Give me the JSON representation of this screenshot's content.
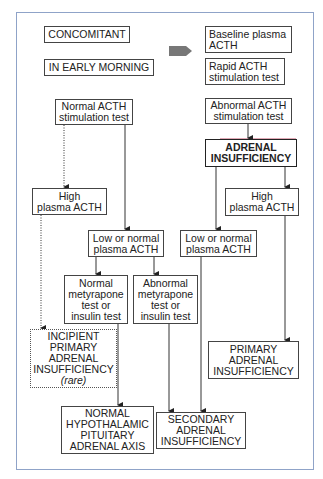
{
  "diagram": {
    "header": {
      "left": [
        "CONCOMITANT",
        "IN EARLY MORNING"
      ],
      "right": [
        {
          "lines": [
            "Baseline plasma",
            "ACTH"
          ]
        },
        {
          "lines": [
            "Rapid ACTH",
            "stimulation test"
          ]
        }
      ]
    },
    "nodes": {
      "normal_acth_stim": {
        "lines": [
          "Normal ACTH",
          "stimulation test"
        ]
      },
      "abnormal_acth_stim": {
        "lines": [
          "Abnormal ACTH",
          "stimulation test"
        ]
      },
      "adrenal_insufficiency": {
        "lines": [
          "ADRENAL",
          "INSUFFICIENCY"
        ]
      },
      "high_plasma_acth_left": {
        "lines": [
          "High",
          "plasma ACTH"
        ]
      },
      "high_plasma_acth_right": {
        "lines": [
          "High",
          "plasma ACTH"
        ]
      },
      "low_normal_acth_left": {
        "lines": [
          "Low or normal",
          "plasma ACTH"
        ]
      },
      "low_normal_acth_right": {
        "lines": [
          "Low or normal",
          "plasma ACTH"
        ]
      },
      "normal_metyrapone": {
        "lines": [
          "Normal",
          "metyrapone",
          "test or",
          "insulin test"
        ]
      },
      "abnormal_metyrapone": {
        "lines": [
          "Abnormal",
          "metyrapone",
          "test or",
          "insulin test"
        ]
      },
      "incipient_primary": {
        "lines": [
          "INCIPIENT",
          "PRIMARY",
          "ADRENAL",
          "INSUFFICIENCY"
        ],
        "note": "(rare)"
      },
      "primary_ai": {
        "lines": [
          "PRIMARY",
          "ADRENAL",
          "INSUFFICIENCY"
        ]
      },
      "normal_hpa": {
        "lines": [
          "NORMAL",
          "HYPOTHALAMIC",
          "PITUITARY",
          "ADRENAL AXIS"
        ]
      },
      "secondary_ai": {
        "lines": [
          "SECONDARY",
          "ADRENAL",
          "INSUFFICIENCY"
        ]
      }
    },
    "edges": [
      {
        "from": "normal_acth_stim",
        "to": "high_plasma_acth_left",
        "style": "dotted"
      },
      {
        "from": "normal_acth_stim",
        "to": "low_normal_acth_left",
        "style": "solid"
      },
      {
        "from": "abnormal_acth_stim",
        "to": "adrenal_insufficiency",
        "style": "solid"
      },
      {
        "from": "adrenal_insufficiency",
        "to": "low_normal_acth_right",
        "style": "solid"
      },
      {
        "from": "adrenal_insufficiency",
        "to": "high_plasma_acth_right",
        "style": "solid"
      },
      {
        "from": "high_plasma_acth_left",
        "to": "incipient_primary",
        "style": "dotted"
      },
      {
        "from": "low_normal_acth_left",
        "to": "normal_metyrapone",
        "style": "solid"
      },
      {
        "from": "low_normal_acth_left",
        "to": "abnormal_metyrapone",
        "style": "solid"
      },
      {
        "from": "normal_metyrapone",
        "to": "normal_hpa",
        "style": "solid"
      },
      {
        "from": "abnormal_metyrapone",
        "to": "secondary_ai",
        "style": "solid"
      },
      {
        "from": "low_normal_acth_right",
        "to": "secondary_ai",
        "style": "solid"
      },
      {
        "from": "high_plasma_acth_right",
        "to": "primary_ai",
        "style": "solid"
      }
    ],
    "colors": {
      "frame": "#8fa3c8",
      "box_border": "#444444",
      "arrow": "#222222",
      "header_arrow": "#777777",
      "accent_line": "#c0506a"
    }
  }
}
